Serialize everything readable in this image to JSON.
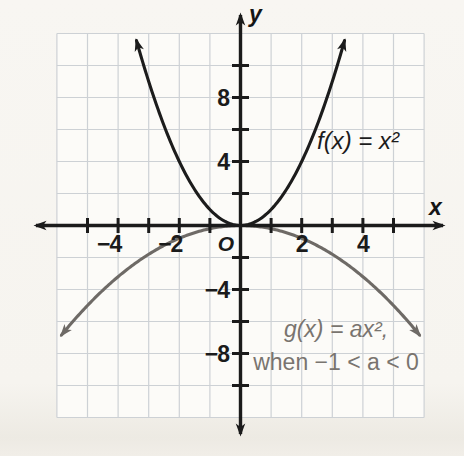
{
  "figure": {
    "axis": {
      "x_label": "x",
      "y_label": "y",
      "origin_label": "O"
    },
    "labels": {
      "f_label": "f(x) = x²",
      "g_label_line1": "g(x) = ax²,",
      "g_label_line2": "when −1 < a < 0"
    }
  },
  "chart_data": {
    "type": "line",
    "xlabel": "x",
    "ylabel": "y",
    "x_range": [
      -6,
      6
    ],
    "y_range": [
      -12,
      12
    ],
    "x_tick_interval": 1,
    "y_tick_interval": 2,
    "grid": true,
    "x_tick_labels": [
      "−4",
      "−2",
      "2",
      "4"
    ],
    "x_tick_label_values": [
      -4,
      -2,
      2,
      4
    ],
    "y_tick_labels": [
      "8",
      "4",
      "−4",
      "−8"
    ],
    "y_tick_label_values": [
      8,
      4,
      -4,
      -8
    ],
    "origin_label": "O",
    "series": [
      {
        "name": "f",
        "equation": "f(x) = x²",
        "a": 1,
        "x_min": -3.4,
        "x_max": 3.4,
        "color": "#1c1c1c",
        "arrows": "both"
      },
      {
        "name": "g",
        "equation": "g(x) = ax², when −1 < a < 0",
        "a": -0.2,
        "x_min": -5.85,
        "x_max": 5.85,
        "color": "#6e6a66",
        "arrows": "both"
      }
    ],
    "colors": {
      "axis": "#1b1b1b",
      "grid": "#cdd1d5",
      "plot_background": "#fcfbf8",
      "f_curve": "#1c1c1c",
      "g_curve": "#6e6a66",
      "g_text": "#79746f",
      "tick_text": "#1b1b1b"
    }
  }
}
